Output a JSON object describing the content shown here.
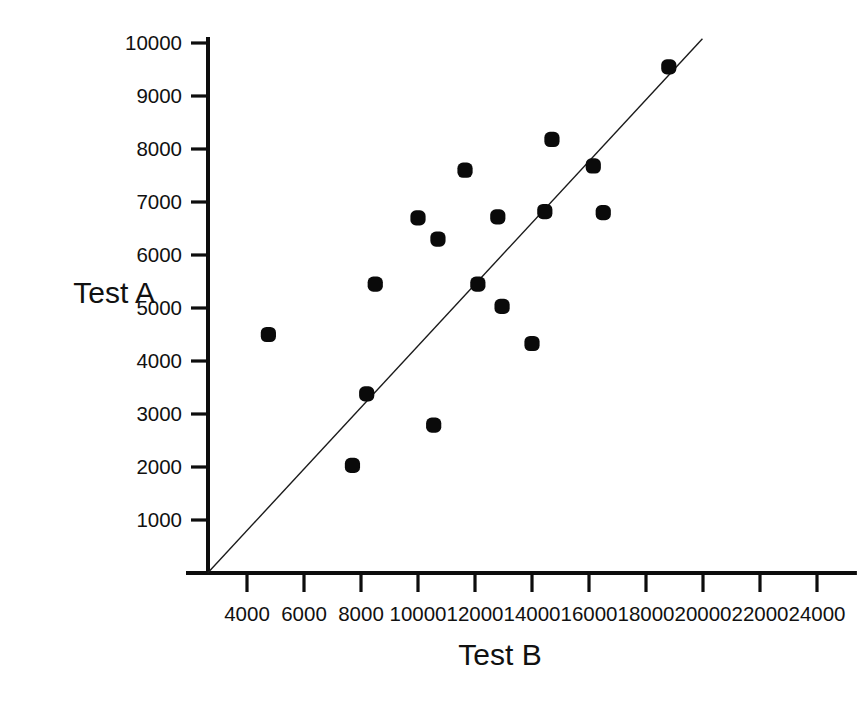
{
  "figure": {
    "background_color": "#ffffff",
    "ink_color": "#0d0d0d",
    "marker_color": "#0a0a0a"
  },
  "chart_data": {
    "type": "scatter",
    "title": "",
    "subtitle": "",
    "xlabel": "Test B",
    "ylabel": "Test A",
    "xlim": [
      2500,
      25500
    ],
    "ylim": [
      0,
      10400
    ],
    "grid": false,
    "legend": "none",
    "x_ticks": [
      4000,
      6000,
      8000,
      10000,
      12000,
      14000,
      16000,
      18000,
      20000,
      22000,
      24000
    ],
    "x_tick_labels": [
      "4000",
      "6000",
      "8000",
      "10000",
      "12000",
      "14000",
      "16000",
      "18000",
      "20000",
      "22000",
      "24000"
    ],
    "y_ticks": [
      1000,
      2000,
      3000,
      4000,
      5000,
      6000,
      7000,
      8000,
      9000,
      10000
    ],
    "y_tick_labels": [
      "1000",
      "2000",
      "3000",
      "4000",
      "5000",
      "6000",
      "7000",
      "8000",
      "9000",
      "10000"
    ],
    "series": [
      {
        "name": "observations",
        "marker": "filled-circle",
        "color": "#0a0a0a",
        "points": [
          {
            "x": 4750,
            "y": 4500
          },
          {
            "x": 7700,
            "y": 2030
          },
          {
            "x": 8200,
            "y": 3380
          },
          {
            "x": 8500,
            "y": 5450
          },
          {
            "x": 10000,
            "y": 6700
          },
          {
            "x": 10550,
            "y": 2790
          },
          {
            "x": 10700,
            "y": 6300
          },
          {
            "x": 11650,
            "y": 7600
          },
          {
            "x": 12100,
            "y": 5450
          },
          {
            "x": 12800,
            "y": 6720
          },
          {
            "x": 12950,
            "y": 5030
          },
          {
            "x": 14000,
            "y": 4330
          },
          {
            "x": 14450,
            "y": 6820
          },
          {
            "x": 14700,
            "y": 8180
          },
          {
            "x": 16150,
            "y": 7680
          },
          {
            "x": 16500,
            "y": 6800
          },
          {
            "x": 18800,
            "y": 9550
          }
        ]
      }
    ],
    "reference_line": {
      "name": "identity-line",
      "description": "straight line from origin rising to the upper right",
      "x_start": 2620,
      "y_start": 0,
      "x_end": 19980,
      "y_end": 10080,
      "color": "#1a1a1a"
    }
  }
}
